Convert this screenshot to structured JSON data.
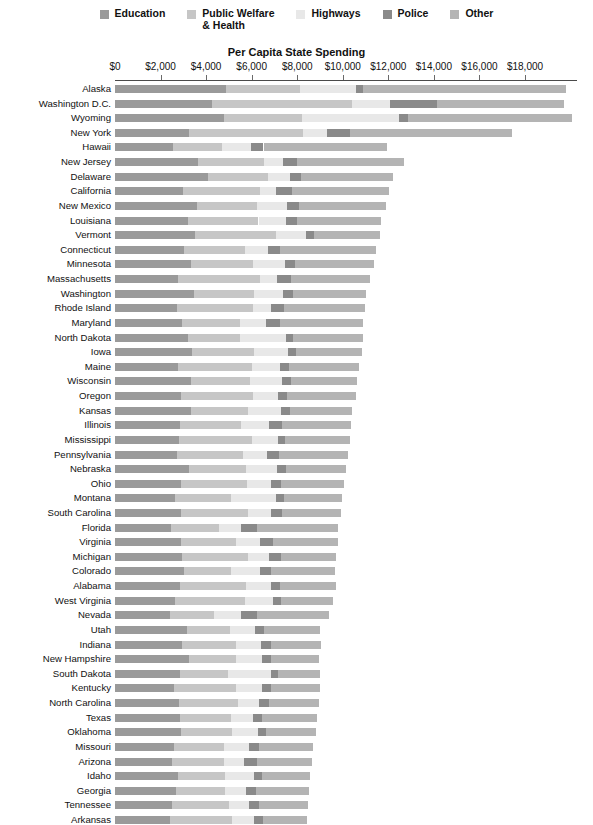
{
  "chart_data": {
    "type": "bar",
    "subtype": "horizontal-stacked",
    "title": "Per Capita State Spending",
    "xlabel": "Per Capita State Spending",
    "ylabel": "",
    "xlim": [
      0,
      19500
    ],
    "grid": false,
    "legend_position": "top-center",
    "tick_values": [
      0,
      2000,
      4000,
      6000,
      8000,
      10000,
      12000,
      14000,
      16000,
      18000
    ],
    "tick_labels": [
      "$0",
      "$2,000",
      "$4,000",
      "$6,000",
      "$8,000",
      "$10,000",
      "$12,000",
      "$14,000",
      "$16,000",
      "$18,000"
    ],
    "series": [
      {
        "name": "Education",
        "color": "#9a9a9a"
      },
      {
        "name": "Public Welfare\n& Health",
        "color": "#c6c6c6"
      },
      {
        "name": "Highways",
        "color": "#e8e8e8"
      },
      {
        "name": "Police",
        "color": "#8a8a8a"
      },
      {
        "name": "Other",
        "color": "#b4b4b4"
      }
    ],
    "categories": [
      "Alaska",
      "Washington D.C.",
      "Wyoming",
      "New York",
      "Hawaii",
      "New Jersey",
      "Delaware",
      "California",
      "New Mexico",
      "Louisiana",
      "Vermont",
      "Connecticut",
      "Minnesota",
      "Massachusetts",
      "Washington",
      "Rhode Island",
      "Maryland",
      "North Dakota",
      "Iowa",
      "Maine",
      "Wisconsin",
      "Oregon",
      "Kansas",
      "Illinois",
      "Mississippi",
      "Pennsylvania",
      "Nebraska",
      "Ohio",
      "Montana",
      "South Carolina",
      "Florida",
      "Virginia",
      "Michigan",
      "Colorado",
      "Alabama",
      "West Virginia",
      "Nevada",
      "Utah",
      "Indiana",
      "New Hampshire",
      "South Dakota",
      "Kentucky",
      "North Carolina",
      "Texas",
      "Oklahoma",
      "Missouri",
      "Arizona",
      "Idaho",
      "Georgia",
      "Tennessee",
      "Arkansas"
    ],
    "values": [
      [
        4870,
        3250,
        2450,
        330,
        8900
      ],
      [
        4280,
        6130,
        1650,
        2080,
        5580
      ],
      [
        4800,
        3400,
        4250,
        400,
        7200
      ],
      [
        3250,
        5000,
        1070,
        1000,
        7100
      ],
      [
        2550,
        2150,
        1250,
        570,
        5400
      ],
      [
        3660,
        2880,
        840,
        620,
        4670
      ],
      [
        4070,
        2650,
        950,
        490,
        4060
      ],
      [
        3000,
        3350,
        720,
        700,
        4280
      ],
      [
        3620,
        2600,
        1340,
        500,
        3830
      ],
      [
        3200,
        3100,
        1200,
        480,
        3700
      ],
      [
        3520,
        3550,
        1320,
        330,
        2900
      ],
      [
        3020,
        2680,
        1000,
        560,
        4180
      ],
      [
        3350,
        2720,
        1400,
        420,
        3480
      ],
      [
        2750,
        3600,
        780,
        600,
        3470
      ],
      [
        3450,
        2670,
        1250,
        450,
        3200
      ],
      [
        2720,
        3350,
        780,
        570,
        3550
      ],
      [
        2950,
        2550,
        1150,
        600,
        3650
      ],
      [
        3220,
        2270,
        2000,
        330,
        3080
      ],
      [
        3400,
        2700,
        1500,
        350,
        2900
      ],
      [
        2750,
        3250,
        1250,
        370,
        3080
      ],
      [
        3320,
        2600,
        1400,
        400,
        2900
      ],
      [
        2900,
        3150,
        1100,
        420,
        3000
      ],
      [
        3320,
        2500,
        1450,
        400,
        2750
      ],
      [
        2850,
        2700,
        1200,
        570,
        3050
      ],
      [
        2800,
        3200,
        1150,
        330,
        2850
      ],
      [
        2700,
        2900,
        1080,
        530,
        3000
      ],
      [
        3270,
        2500,
        1350,
        380,
        2650
      ],
      [
        2900,
        2900,
        1050,
        450,
        2750
      ],
      [
        2650,
        2450,
        1950,
        370,
        2550
      ],
      [
        2900,
        2950,
        1000,
        480,
        2600
      ],
      [
        2450,
        2100,
        1000,
        670,
        3580
      ],
      [
        2900,
        2400,
        1070,
        550,
        2850
      ],
      [
        2950,
        2900,
        920,
        500,
        2450
      ],
      [
        3050,
        2050,
        1250,
        520,
        2800
      ],
      [
        2850,
        2900,
        1100,
        400,
        2450
      ],
      [
        2650,
        3050,
        1220,
        380,
        2250
      ],
      [
        2400,
        1950,
        1200,
        680,
        3150
      ],
      [
        3150,
        1900,
        1100,
        400,
        2450
      ],
      [
        2950,
        2350,
        1120,
        430,
        2200
      ],
      [
        3250,
        2050,
        1170,
        380,
        2100
      ],
      [
        2850,
        2100,
        1900,
        300,
        1850
      ],
      [
        2600,
        2700,
        1150,
        400,
        2150
      ],
      [
        2800,
        2620,
        900,
        450,
        2200
      ],
      [
        2850,
        2250,
        950,
        400,
        2400
      ],
      [
        2900,
        2220,
        1150,
        370,
        2180
      ],
      [
        2600,
        2200,
        1100,
        430,
        2350
      ],
      [
        2500,
        2280,
        900,
        550,
        2420
      ],
      [
        2750,
        2100,
        1250,
        370,
        2070
      ],
      [
        2680,
        2150,
        900,
        450,
        2330
      ],
      [
        2500,
        2500,
        900,
        430,
        2150
      ],
      [
        2400,
        2750,
        950,
        400,
        1950
      ]
    ]
  },
  "layout": {
    "plot_left": 115,
    "plot_right": 577,
    "axis_y": 80,
    "first_row_y": 85,
    "row_pitch": 14.62,
    "bar_height": 8,
    "px_per_dollar": 0.022778
  }
}
